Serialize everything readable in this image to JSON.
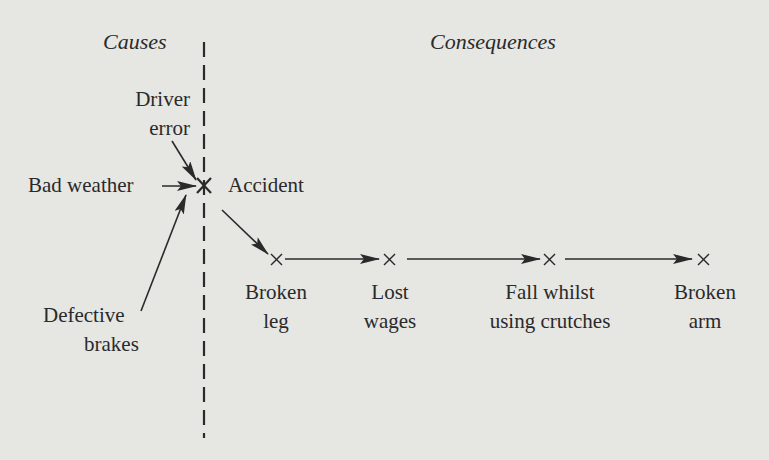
{
  "diagram": {
    "headers": {
      "causes": "Causes",
      "consequences": "Consequences"
    },
    "causes": [
      {
        "id": "driver_error",
        "line1": "Driver",
        "line2": "error"
      },
      {
        "id": "bad_weather",
        "line1": "Bad weather"
      },
      {
        "id": "defective_brakes",
        "line1": "Defective",
        "line2": "brakes"
      }
    ],
    "event": {
      "id": "accident",
      "label": "Accident",
      "marker": "×"
    },
    "consequences": [
      {
        "id": "broken_leg",
        "line1": "Broken",
        "line2": "leg",
        "marker": "×"
      },
      {
        "id": "lost_wages",
        "line1": "Lost",
        "line2": "wages",
        "marker": "×"
      },
      {
        "id": "fall",
        "line1": "Fall whilst",
        "line2": "using crutches",
        "marker": "×"
      },
      {
        "id": "broken_arm",
        "line1": "Broken",
        "line2": "arm",
        "marker": "×"
      }
    ],
    "edges": [
      [
        "driver_error",
        "accident"
      ],
      [
        "bad_weather",
        "accident"
      ],
      [
        "defective_brakes",
        "accident"
      ],
      [
        "accident",
        "broken_leg"
      ],
      [
        "broken_leg",
        "lost_wages"
      ],
      [
        "lost_wages",
        "fall"
      ],
      [
        "fall",
        "broken_arm"
      ]
    ],
    "colors": {
      "background": "#e6e6e3",
      "ink": "#2a2a2a"
    }
  }
}
